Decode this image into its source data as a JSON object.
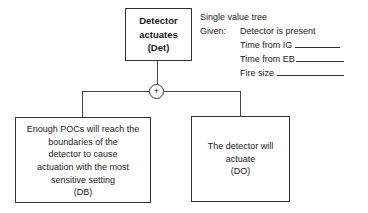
{
  "diagram": {
    "type": "single-value-tree",
    "root": {
      "lines": [
        "Detector",
        "actuates",
        "(Det)"
      ],
      "label": "Detector actuates",
      "code": "Det"
    },
    "gate": {
      "symbol": "+",
      "meaning": "AND/sum junction"
    },
    "children": [
      {
        "lines": [
          "Enough POCs will reach the",
          "boundaries of the",
          "detector to cause",
          "actuation with the most",
          "sensitive setting",
          "(DB)"
        ],
        "code": "DB"
      },
      {
        "lines": [
          "The detector will",
          "actuate",
          "(DO)"
        ],
        "code": "DO"
      }
    ],
    "notes": {
      "title": "Single value tree",
      "given_label": "Given:",
      "given_items": [
        {
          "label": "Detector is present",
          "blank": false
        },
        {
          "label": "Time from IG",
          "blank": true
        },
        {
          "label": "Time from EB",
          "blank": true
        },
        {
          "label": "Fire size",
          "blank": true
        }
      ]
    },
    "edges": [
      {
        "from": "Det",
        "to": "gate"
      },
      {
        "from": "gate",
        "to": "DB"
      },
      {
        "from": "gate",
        "to": "DO"
      }
    ]
  }
}
